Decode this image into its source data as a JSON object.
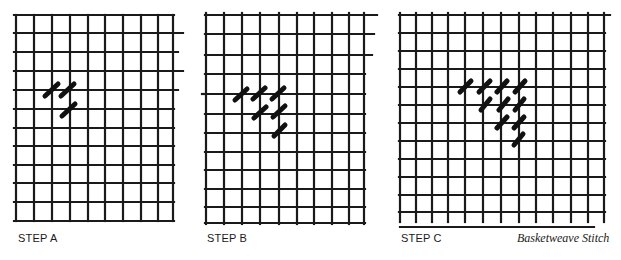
{
  "figure": {
    "caption": "Basketweave Stitch",
    "colors": {
      "grid": "#1a1a1a",
      "stitch": "#111111",
      "background": "#ffffff"
    }
  },
  "panels": [
    {
      "label": "STEP A",
      "label_x": 18,
      "verticals": [
        16,
        34,
        52,
        70,
        88,
        105,
        123,
        141,
        158,
        173
      ],
      "horizontals": [
        15,
        33,
        52,
        71,
        90,
        109,
        128,
        146,
        165,
        183,
        202,
        221
      ],
      "x_start": 14,
      "x_end": 174,
      "y_start": 15,
      "y_end": 221,
      "extensions": [
        {
          "y": 33,
          "x_end": 183
        },
        {
          "y": 52,
          "x_end": 178
        },
        {
          "y": 71,
          "x_end": 183
        },
        {
          "y": 90,
          "x_end": 178
        }
      ],
      "stitches": [
        [
          45,
          96,
          58,
          84
        ],
        [
          61,
          96,
          74,
          84
        ],
        [
          62,
          116,
          75,
          104
        ]
      ]
    },
    {
      "label": "STEP B",
      "label_x": 207,
      "verticals": [
        206,
        224,
        242,
        260,
        279,
        297,
        314,
        332,
        349,
        364
      ],
      "horizontals": [
        15,
        34,
        55,
        74,
        94,
        114,
        133,
        152,
        170,
        189,
        207,
        223
      ],
      "x_start": 205,
      "x_end": 365,
      "y_start": 13,
      "y_end": 224,
      "extensions": [
        {
          "y": 15,
          "x_end": 377
        },
        {
          "y": 34,
          "x_end": 374
        },
        {
          "y": 55,
          "x_end": 372
        }
      ],
      "dashed_start": {
        "y": 94,
        "x_start": 202
      },
      "stitches": [
        [
          235,
          100,
          247,
          89
        ],
        [
          253,
          99,
          265,
          88
        ],
        [
          272,
          99,
          284,
          88
        ],
        [
          254,
          118,
          266,
          107
        ],
        [
          273,
          117,
          285,
          106
        ],
        [
          274,
          136,
          285,
          125
        ]
      ]
    },
    {
      "label": "STEP C",
      "label_x": 401,
      "verticals": [
        400,
        416,
        432,
        448,
        465,
        483,
        501,
        519,
        536,
        553,
        571,
        588,
        604
      ],
      "horizontals": [
        15,
        33,
        51,
        69,
        87,
        105,
        123,
        141,
        159,
        177,
        195,
        212
      ],
      "x_start": 399,
      "x_end": 605,
      "y_start": 13,
      "y_end": 222,
      "extensions": [
        {
          "y": 15,
          "x_end": 610
        }
      ],
      "bottom_line": {
        "y": 227,
        "x_start": 400,
        "x_end": 594
      },
      "stitches": [
        [
          460,
          92,
          471,
          81
        ],
        [
          479,
          92,
          490,
          81
        ],
        [
          497,
          92,
          507,
          81
        ],
        [
          515,
          92,
          525,
          81
        ],
        [
          481,
          110,
          490,
          99
        ],
        [
          499,
          110,
          508,
          99
        ],
        [
          515,
          110,
          524,
          99
        ],
        [
          497,
          128,
          507,
          117
        ],
        [
          514,
          128,
          524,
          117
        ],
        [
          514,
          145,
          523,
          134
        ]
      ]
    }
  ]
}
